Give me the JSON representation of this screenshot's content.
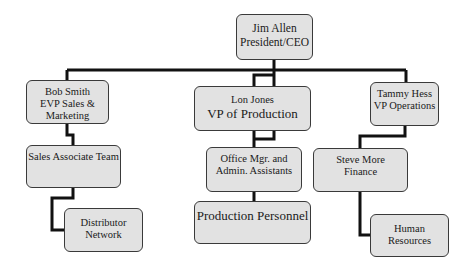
{
  "chart": {
    "root": {
      "name": "Jim Allen",
      "title": "President/CEO"
    },
    "nodes": [
      {
        "id": "bob",
        "lines": [
          "Bob Smith",
          "EVP Sales &",
          "Marketing"
        ]
      },
      {
        "id": "lon",
        "lines": [
          "Lon Jones",
          "VP of Production"
        ]
      },
      {
        "id": "tammy",
        "lines": [
          "Tammy Hess",
          "VP Operations"
        ]
      },
      {
        "id": "sales",
        "lines": [
          "Sales Associate Team"
        ]
      },
      {
        "id": "office",
        "lines": [
          "Office Mgr. and",
          "Admin. Assistants"
        ]
      },
      {
        "id": "steve",
        "lines": [
          "Steve More",
          "Finance"
        ]
      },
      {
        "id": "distributor",
        "lines": [
          "Distributor",
          "Network"
        ]
      },
      {
        "id": "production",
        "lines": [
          "Production Personnel"
        ]
      },
      {
        "id": "hr",
        "lines": [
          "Human",
          "Resources"
        ]
      }
    ],
    "colors": {
      "box_fill": "#e2e2e2",
      "box_border": "#3a3a3a",
      "connector": "#111111"
    }
  }
}
